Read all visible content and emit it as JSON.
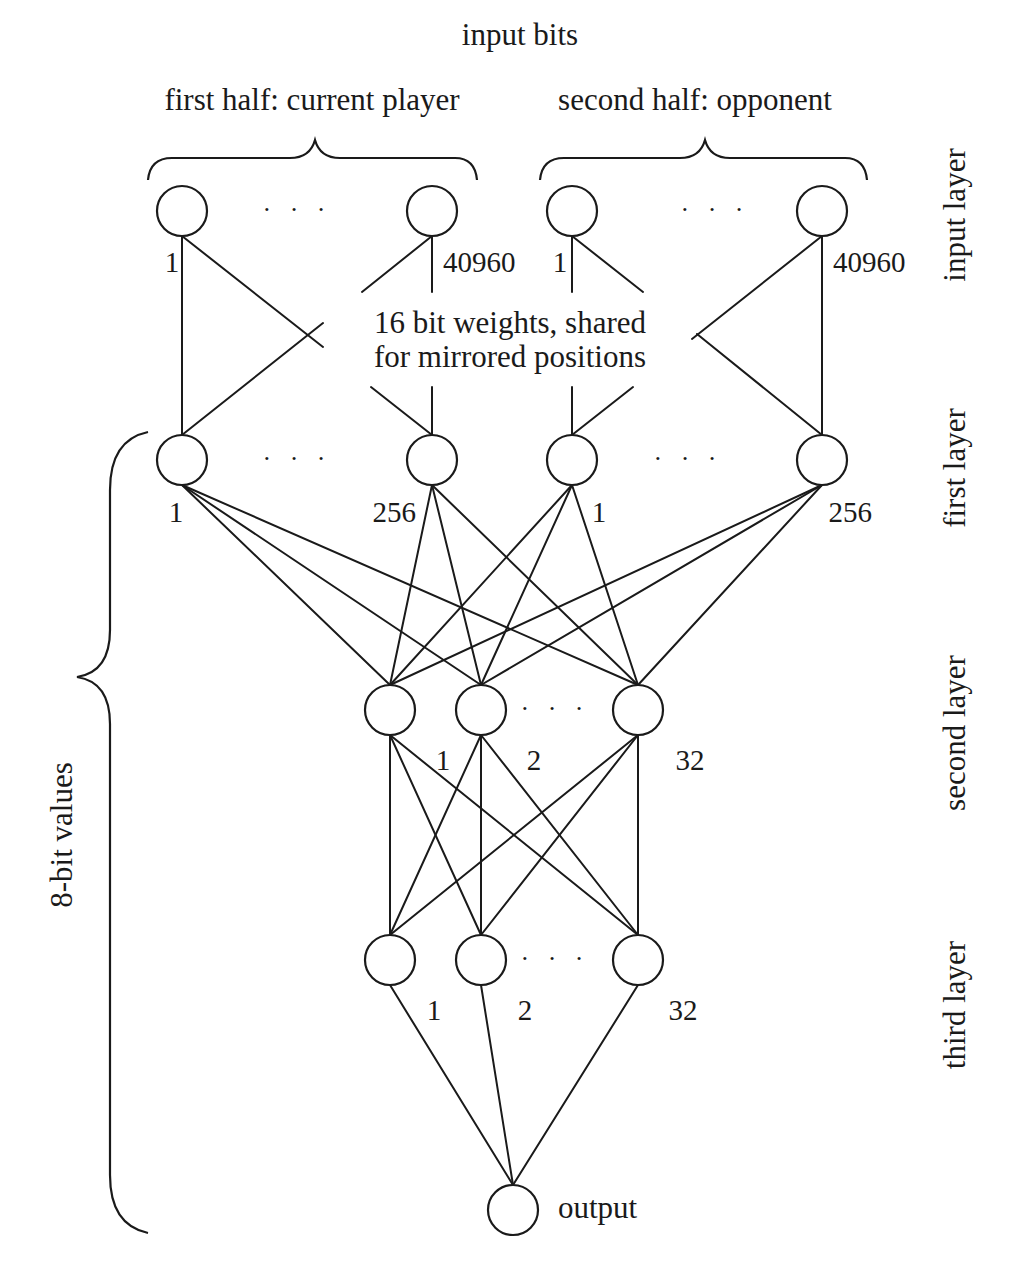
{
  "title": "input bits",
  "groups": {
    "first": "first half: current player",
    "second": "second half: opponent"
  },
  "annotation": {
    "line1": "16 bit weights, shared",
    "line2": "for mirrored positions"
  },
  "side_brace_label": "8-bit values",
  "layer_labels": {
    "input": "input layer",
    "first": "first layer",
    "second": "second layer",
    "third": "third layer"
  },
  "ellipsis": "· · ·",
  "output_label": "output",
  "input_layer": {
    "nodes": [
      {
        "id": "in_a1",
        "label": "1",
        "x": 182,
        "y": 211
      },
      {
        "id": "in_a40960",
        "label": "40960",
        "x": 432,
        "y": 211
      },
      {
        "id": "in_b1",
        "label": "1",
        "x": 572,
        "y": 211
      },
      {
        "id": "in_b40960",
        "label": "40960",
        "x": 822,
        "y": 211
      }
    ]
  },
  "first_layer": {
    "nodes": [
      {
        "id": "f_a1",
        "label": "1",
        "x": 182,
        "y": 460
      },
      {
        "id": "f_a256",
        "label": "256",
        "x": 432,
        "y": 460
      },
      {
        "id": "f_b1",
        "label": "1",
        "x": 572,
        "y": 460
      },
      {
        "id": "f_b256",
        "label": "256",
        "x": 822,
        "y": 460
      }
    ]
  },
  "second_layer": {
    "nodes": [
      {
        "id": "s1",
        "label": "1",
        "x": 390,
        "y": 710
      },
      {
        "id": "s2",
        "label": "2",
        "x": 481,
        "y": 710
      },
      {
        "id": "s32",
        "label": "32",
        "x": 638,
        "y": 710
      }
    ]
  },
  "third_layer": {
    "nodes": [
      {
        "id": "t1",
        "label": "1",
        "x": 390,
        "y": 960
      },
      {
        "id": "t2",
        "label": "2",
        "x": 481,
        "y": 960
      },
      {
        "id": "t32",
        "label": "32",
        "x": 638,
        "y": 960
      }
    ]
  },
  "output_node": {
    "id": "out",
    "x": 513,
    "y": 1210
  },
  "node_radius": 25,
  "colors": {
    "ink": "#1a1a1a",
    "background": "#ffffff"
  }
}
